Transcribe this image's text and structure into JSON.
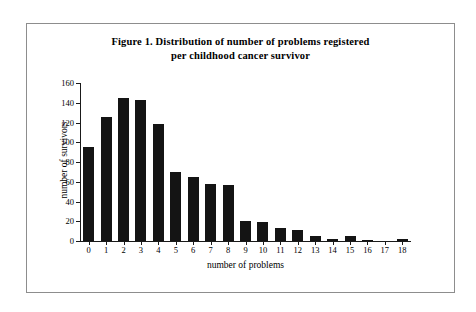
{
  "figure": {
    "title_line1": "Figure 1. Distribution of number of problems registered",
    "title_line2": "per childhood cancer survivor"
  },
  "chart_data": {
    "type": "bar",
    "title": "Figure 1. Distribution of number of problems registered per childhood cancer survivor",
    "xlabel": "number of problems",
    "ylabel": "number of survivors",
    "categories": [
      "0",
      "1",
      "2",
      "3",
      "4",
      "5",
      "6",
      "7",
      "8",
      "9",
      "10",
      "11",
      "12",
      "13",
      "14",
      "15",
      "16",
      "17",
      "18"
    ],
    "values": [
      95,
      126,
      145,
      143,
      119,
      70,
      65,
      58,
      57,
      20,
      19,
      13,
      11,
      5,
      2,
      5,
      1,
      0,
      2
    ],
    "xlim": [
      -0.5,
      18.5
    ],
    "ylim": [
      0,
      160
    ],
    "yticks": [
      0,
      20,
      40,
      60,
      80,
      100,
      120,
      140,
      160
    ],
    "ytick_labels": [
      "0",
      "20",
      "40",
      "60",
      "80",
      "100",
      "120",
      "140",
      "160"
    ],
    "grid": false,
    "legend": null,
    "bar_color": "#141414"
  }
}
